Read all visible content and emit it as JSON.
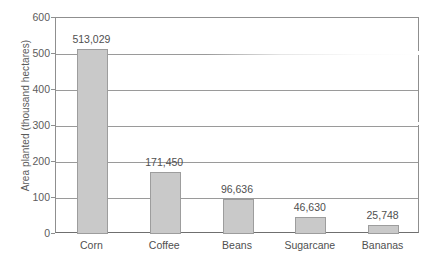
{
  "chart_data": {
    "type": "bar",
    "title": "",
    "xlabel": "",
    "ylabel": "Area planted (thousand hectares)",
    "categories": [
      "Corn",
      "Coffee",
      "Beans",
      "Sugarcane",
      "Bananas"
    ],
    "values": [
      513029,
      171450,
      96636,
      46630,
      25748
    ],
    "value_labels": [
      "513,029",
      "171,450",
      "96,636",
      "46,630",
      "25,748"
    ],
    "values_in_axis_units": [
      513.029,
      171.45,
      96.636,
      46.63,
      25.748
    ],
    "ylim": [
      0,
      600
    ],
    "y_ticks": [
      0,
      100,
      200,
      300,
      400,
      500,
      600
    ],
    "y_tick_labels": [
      "0",
      "100",
      "200",
      "300",
      "400",
      "500",
      "600"
    ],
    "grid": "horizontal",
    "legend": "none",
    "bar_color": "#c9c9c9",
    "bar_border_color": "#9d9d9d",
    "axis_color": "#8f8f8f",
    "text_color": "#4f4f4f",
    "background": "#ffffff",
    "units": "hectares (labels); axis in thousand hectares"
  },
  "footer": {
    "remnant_text": ""
  }
}
